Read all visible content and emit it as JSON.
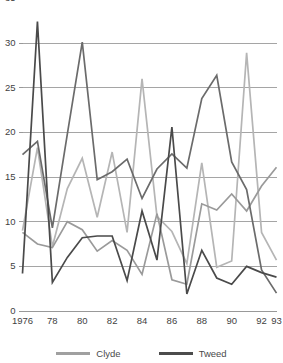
{
  "chart_data": {
    "type": "line",
    "title": "",
    "subtitle": "",
    "xlabel": "",
    "ylabel": "",
    "xlim": [
      1976,
      1993
    ],
    "ylim": [
      0,
      35
    ],
    "grid": true,
    "gridline_values": [
      0,
      5,
      10,
      15,
      20,
      25,
      30,
      35
    ],
    "ytick_labels": [
      "0",
      "5",
      "10",
      "15",
      "20",
      "25",
      "30",
      "35"
    ],
    "ytick_values": [
      0,
      5,
      10,
      15,
      20,
      25,
      30,
      35
    ],
    "x": [
      1976,
      1977,
      1978,
      1979,
      1980,
      1981,
      1982,
      1983,
      1984,
      1985,
      1986,
      1987,
      1988,
      1989,
      1990,
      1991,
      1992,
      1993
    ],
    "xtick_labels": [
      "1976",
      "78",
      "80",
      "82",
      "84",
      "86",
      "88",
      "90",
      "92",
      "93"
    ],
    "xtick_values": [
      1976,
      1978,
      1980,
      1982,
      1984,
      1986,
      1988,
      1990,
      1992,
      1993
    ],
    "legend_position": "bottom",
    "legend": [
      "Clyde",
      "Tweed"
    ],
    "series": [
      {
        "name": "Clyde",
        "color": "#b5b5b5",
        "values": [
          9.0,
          18.3,
          7.2,
          13.7,
          17.1,
          10.5,
          17.8,
          8.8,
          26.0,
          10.6,
          8.9,
          5.3,
          16.6,
          4.9,
          5.6,
          28.9,
          8.8,
          5.7
        ]
      },
      {
        "name": "Clyde-secondary",
        "color": "#9a9a9a",
        "values": [
          8.8,
          7.5,
          7.1,
          10.0,
          9.1,
          6.7,
          7.9,
          6.8,
          4.1,
          10.9,
          3.5,
          3.0,
          12.0,
          11.3,
          13.1,
          11.2,
          14.0,
          16.1
        ]
      },
      {
        "name": "Tweed",
        "color": "#6b6b6b",
        "values": [
          17.5,
          19.0,
          9.3,
          19.8,
          30.1,
          14.7,
          15.6,
          17.0,
          12.6,
          15.9,
          17.6,
          16.0,
          23.8,
          26.4,
          16.7,
          13.6,
          4.6,
          2.0
        ]
      },
      {
        "name": "Tweed-secondary",
        "color": "#4a4a4a",
        "values": [
          4.2,
          32.4,
          3.2,
          6.0,
          8.2,
          8.4,
          8.4,
          3.4,
          11.2,
          5.7,
          20.6,
          1.9,
          6.8,
          3.7,
          3.0,
          5.0,
          4.3,
          3.8
        ]
      }
    ]
  },
  "legend": {
    "entries": [
      {
        "label": "Clyde",
        "color": "#a0a0a0"
      },
      {
        "label": "Tweed",
        "color": "#4c4c4c"
      }
    ]
  }
}
